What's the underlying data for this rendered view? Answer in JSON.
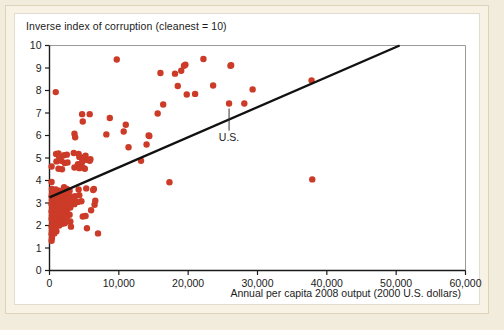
{
  "figure": {
    "title": "Inverse index of corruption (cleanest = 10)",
    "xlabel": "Annual per capita 2008 output (2000 U.S. dollars)",
    "annotation_label": "U.S.",
    "dot_color": "#cc3b28",
    "line_color": "#111111",
    "axis_color": "#1b1b1b",
    "panel_color": "#ffffff",
    "mat_color": "#f7f2e4"
  },
  "chart_data": {
    "type": "scatter",
    "title": "Inverse index of corruption (cleanest = 10)",
    "subtitle": "",
    "xlabel": "Annual per capita 2008 output (2000 U.S. dollars)",
    "ylabel": "Inverse index of corruption (cleanest = 10)",
    "xlim": [
      0,
      60000
    ],
    "ylim": [
      0,
      10
    ],
    "xticks": [
      0,
      10000,
      20000,
      30000,
      40000,
      50000,
      60000
    ],
    "xtick_labels": [
      "0",
      "10,000",
      "20,000",
      "30,000",
      "40,000",
      "50,000",
      "60,000"
    ],
    "yticks": [
      0,
      1,
      2,
      3,
      4,
      5,
      6,
      7,
      8,
      9,
      10
    ],
    "ytick_labels": [
      "0",
      "1",
      "2",
      "3",
      "4",
      "5",
      "6",
      "7",
      "8",
      "9",
      "10"
    ],
    "grid": false,
    "legend": false,
    "marker_color": "#cc3b28",
    "marker_size": 4.6,
    "series": [
      {
        "name": "Countries",
        "points": [
          [
            300,
            4.62
          ],
          [
            300,
            3.93
          ],
          [
            350,
            3.62
          ],
          [
            400,
            3.45
          ],
          [
            300,
            3.3
          ],
          [
            350,
            3.12
          ],
          [
            300,
            2.95
          ],
          [
            400,
            2.8
          ],
          [
            300,
            2.62
          ],
          [
            350,
            2.45
          ],
          [
            300,
            2.3
          ],
          [
            400,
            2.12
          ],
          [
            300,
            1.95
          ],
          [
            350,
            1.78
          ],
          [
            300,
            1.62
          ],
          [
            350,
            1.45
          ],
          [
            300,
            1.32
          ],
          [
            600,
            3.52
          ],
          [
            650,
            3.28
          ],
          [
            700,
            3.05
          ],
          [
            600,
            2.88
          ],
          [
            700,
            2.7
          ],
          [
            650,
            2.52
          ],
          [
            600,
            2.35
          ],
          [
            700,
            2.18
          ],
          [
            650,
            2.0
          ],
          [
            600,
            1.82
          ],
          [
            700,
            1.65
          ],
          [
            900,
            7.93
          ],
          [
            950,
            5.18
          ],
          [
            1000,
            4.85
          ],
          [
            900,
            3.6
          ],
          [
            1000,
            3.4
          ],
          [
            950,
            3.2
          ],
          [
            900,
            3.0
          ],
          [
            1000,
            2.85
          ],
          [
            950,
            2.65
          ],
          [
            900,
            2.45
          ],
          [
            1000,
            2.28
          ],
          [
            950,
            2.1
          ],
          [
            900,
            1.92
          ],
          [
            1000,
            1.75
          ],
          [
            1300,
            5.2
          ],
          [
            1400,
            5.05
          ],
          [
            1300,
            4.52
          ],
          [
            1400,
            3.55
          ],
          [
            1300,
            3.35
          ],
          [
            1400,
            3.15
          ],
          [
            1300,
            2.95
          ],
          [
            1400,
            2.75
          ],
          [
            1300,
            2.55
          ],
          [
            1400,
            2.35
          ],
          [
            1300,
            2.18
          ],
          [
            1400,
            2.0
          ],
          [
            1700,
            4.88
          ],
          [
            1800,
            4.5
          ],
          [
            1700,
            3.48
          ],
          [
            1800,
            3.28
          ],
          [
            1700,
            3.08
          ],
          [
            1800,
            2.88
          ],
          [
            1700,
            2.68
          ],
          [
            1800,
            2.48
          ],
          [
            1700,
            2.28
          ],
          [
            1800,
            2.08
          ],
          [
            2100,
            5.12
          ],
          [
            2200,
            4.78
          ],
          [
            2100,
            3.7
          ],
          [
            2200,
            3.42
          ],
          [
            2100,
            3.18
          ],
          [
            2200,
            2.98
          ],
          [
            2100,
            2.72
          ],
          [
            2200,
            2.52
          ],
          [
            2100,
            2.3
          ],
          [
            2200,
            2.1
          ],
          [
            2500,
            5.15
          ],
          [
            2600,
            4.8
          ],
          [
            2500,
            3.62
          ],
          [
            2600,
            3.35
          ],
          [
            2500,
            3.12
          ],
          [
            2600,
            2.9
          ],
          [
            2500,
            2.65
          ],
          [
            2600,
            2.42
          ],
          [
            2500,
            2.18
          ],
          [
            2900,
            3.55
          ],
          [
            3000,
            3.3
          ],
          [
            2900,
            3.05
          ],
          [
            3000,
            2.8
          ],
          [
            2900,
            2.48
          ],
          [
            3000,
            2.18
          ],
          [
            3100,
            1.95
          ],
          [
            3600,
            6.08
          ],
          [
            3700,
            5.92
          ],
          [
            3500,
            5.22
          ],
          [
            3600,
            4.58
          ],
          [
            3700,
            3.3
          ],
          [
            3500,
            3.08
          ],
          [
            3600,
            2.95
          ],
          [
            4200,
            5.18
          ],
          [
            4300,
            5.05
          ],
          [
            4100,
            4.72
          ],
          [
            4300,
            4.55
          ],
          [
            4200,
            3.6
          ],
          [
            4300,
            3.35
          ],
          [
            4100,
            3.05
          ],
          [
            4700,
            6.95
          ],
          [
            4800,
            6.62
          ],
          [
            4900,
            5.02
          ],
          [
            4700,
            4.82
          ],
          [
            4800,
            4.58
          ],
          [
            4600,
            3.08
          ],
          [
            4800,
            2.4
          ],
          [
            5200,
            5.1
          ],
          [
            5300,
            4.92
          ],
          [
            5100,
            4.52
          ],
          [
            5300,
            3.65
          ],
          [
            5200,
            2.42
          ],
          [
            5400,
            1.88
          ],
          [
            5800,
            6.95
          ],
          [
            5900,
            4.95
          ],
          [
            5800,
            4.88
          ],
          [
            6000,
            2.68
          ],
          [
            6300,
            3.58
          ],
          [
            6400,
            3.62
          ],
          [
            6500,
            2.92
          ],
          [
            6600,
            3.1
          ],
          [
            7000,
            1.65
          ],
          [
            8200,
            6.05
          ],
          [
            8700,
            6.78
          ],
          [
            9700,
            9.38
          ],
          [
            10700,
            6.18
          ],
          [
            11000,
            6.48
          ],
          [
            11400,
            5.48
          ],
          [
            13200,
            4.88
          ],
          [
            14000,
            5.6
          ],
          [
            14300,
            6.0
          ],
          [
            14400,
            5.98
          ],
          [
            15600,
            6.98
          ],
          [
            16000,
            8.78
          ],
          [
            16400,
            7.38
          ],
          [
            17300,
            3.92
          ],
          [
            18100,
            8.75
          ],
          [
            18500,
            8.2
          ],
          [
            19000,
            8.88
          ],
          [
            19400,
            9.1
          ],
          [
            19600,
            9.15
          ],
          [
            19800,
            7.82
          ],
          [
            21000,
            7.85
          ],
          [
            22200,
            9.4
          ],
          [
            23600,
            8.22
          ],
          [
            25900,
            7.42
          ],
          [
            26100,
            9.1
          ],
          [
            26200,
            9.12
          ],
          [
            28100,
            7.42
          ],
          [
            29300,
            8.05
          ],
          [
            37800,
            8.45
          ],
          [
            37900,
            4.05
          ]
        ]
      }
    ],
    "trend_line": {
      "name": "fitted regression line",
      "x_start": 0,
      "y_start": 3.25,
      "x_end": 50500,
      "y_end": 10.0
    },
    "annotations": [
      {
        "label": "U.S.",
        "x": 25900,
        "y": 7.42,
        "label_x": 25900,
        "label_y": 6.35
      }
    ]
  }
}
